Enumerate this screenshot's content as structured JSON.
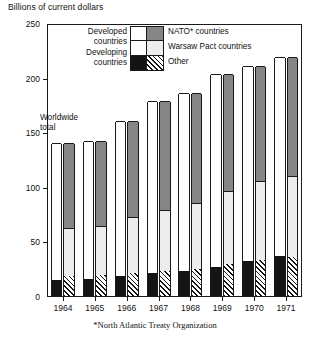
{
  "figure": {
    "axis_title": "Billions of current dollars",
    "annotation_line1": "Worldwide",
    "annotation_line2": "total",
    "footnote": "*North Atlantic Treaty Organization"
  },
  "legend": {
    "left_labels": [
      {
        "line1": "Developed",
        "line2": "countries"
      },
      {
        "line1": "Developing",
        "line2": "countries"
      }
    ],
    "right_labels": [
      "NATO* countries",
      "Warsaw Pact countries",
      "Other"
    ],
    "swatch_names": [
      "developed-white",
      "nato-dark-gray",
      "warsaw-light-gray",
      "developing-black",
      "other-hatched"
    ]
  },
  "colors": {
    "nato": "#868686",
    "warsaw": "#ededed",
    "developed": "#ffffff",
    "developing": "#141414",
    "other_hatch": "#141414",
    "axis": "#1a1a1a"
  },
  "chart_data": {
    "type": "bar",
    "title": "",
    "subtitle": "",
    "xlabel": "",
    "ylabel": "Billions of current dollars",
    "ylim": [
      0,
      250
    ],
    "yticks": [
      0,
      50,
      100,
      150,
      200,
      250
    ],
    "grid": false,
    "legend_position": "inside-top-left",
    "categories": [
      "1964",
      "1965",
      "1966",
      "1967",
      "1968",
      "1969",
      "1970",
      "1971"
    ],
    "totals": [
      140,
      142,
      160,
      179,
      186,
      203,
      211,
      219
    ],
    "bar_pairs": [
      {
        "year": "1964",
        "left_bar": {
          "name": "development-split",
          "segments": [
            {
              "key": "developed",
              "label": "Developed countries",
              "value": 125
            },
            {
              "key": "developing",
              "label": "Developing countries",
              "value": 15
            }
          ]
        },
        "right_bar": {
          "name": "alliance-split",
          "segments": [
            {
              "key": "nato",
              "label": "NATO* countries",
              "value": 78
            },
            {
              "key": "warsaw",
              "label": "Warsaw Pact countries",
              "value": 44
            },
            {
              "key": "other",
              "label": "Other",
              "value": 18
            }
          ]
        }
      },
      {
        "year": "1965",
        "left_bar": {
          "name": "development-split",
          "segments": [
            {
              "key": "developed",
              "label": "Developed countries",
              "value": 126
            },
            {
              "key": "developing",
              "label": "Developing countries",
              "value": 16
            }
          ]
        },
        "right_bar": {
          "name": "alliance-split",
          "segments": [
            {
              "key": "nato",
              "label": "NATO* countries",
              "value": 78
            },
            {
              "key": "warsaw",
              "label": "Warsaw Pact countries",
              "value": 45
            },
            {
              "key": "other",
              "label": "Other",
              "value": 19
            }
          ]
        }
      },
      {
        "year": "1966",
        "left_bar": {
          "name": "development-split",
          "segments": [
            {
              "key": "developed",
              "label": "Developed countries",
              "value": 142
            },
            {
              "key": "developing",
              "label": "Developing countries",
              "value": 18
            }
          ]
        },
        "right_bar": {
          "name": "alliance-split",
          "segments": [
            {
              "key": "nato",
              "label": "NATO* countries",
              "value": 88
            },
            {
              "key": "warsaw",
              "label": "Warsaw Pact countries",
              "value": 51
            },
            {
              "key": "other",
              "label": "Other",
              "value": 21
            }
          ]
        }
      },
      {
        "year": "1967",
        "left_bar": {
          "name": "development-split",
          "segments": [
            {
              "key": "developed",
              "label": "Developed countries",
              "value": 158
            },
            {
              "key": "developing",
              "label": "Developing countries",
              "value": 21
            }
          ]
        },
        "right_bar": {
          "name": "alliance-split",
          "segments": [
            {
              "key": "nato",
              "label": "NATO* countries",
              "value": 100
            },
            {
              "key": "warsaw",
              "label": "Warsaw Pact countries",
              "value": 56
            },
            {
              "key": "other",
              "label": "Other",
              "value": 23
            }
          ]
        }
      },
      {
        "year": "1968",
        "left_bar": {
          "name": "development-split",
          "segments": [
            {
              "key": "developed",
              "label": "Developed countries",
              "value": 163
            },
            {
              "key": "developing",
              "label": "Developing countries",
              "value": 23
            }
          ]
        },
        "right_bar": {
          "name": "alliance-split",
          "segments": [
            {
              "key": "nato",
              "label": "NATO* countries",
              "value": 101
            },
            {
              "key": "warsaw",
              "label": "Warsaw Pact countries",
              "value": 60
            },
            {
              "key": "other",
              "label": "Other",
              "value": 25
            }
          ]
        }
      },
      {
        "year": "1969",
        "left_bar": {
          "name": "development-split",
          "segments": [
            {
              "key": "developed",
              "label": "Developed countries",
              "value": 176
            },
            {
              "key": "developing",
              "label": "Developing countries",
              "value": 27
            }
          ]
        },
        "right_bar": {
          "name": "alliance-split",
          "segments": [
            {
              "key": "nato",
              "label": "NATO* countries",
              "value": 107
            },
            {
              "key": "warsaw",
              "label": "Warsaw Pact countries",
              "value": 67
            },
            {
              "key": "other",
              "label": "Other",
              "value": 29
            }
          ]
        }
      },
      {
        "year": "1970",
        "left_bar": {
          "name": "development-split",
          "segments": [
            {
              "key": "developed",
              "label": "Developed countries",
              "value": 179
            },
            {
              "key": "developing",
              "label": "Developing countries",
              "value": 32
            }
          ]
        },
        "right_bar": {
          "name": "alliance-split",
          "segments": [
            {
              "key": "nato",
              "label": "NATO* countries",
              "value": 106
            },
            {
              "key": "warsaw",
              "label": "Warsaw Pact countries",
              "value": 72
            },
            {
              "key": "other",
              "label": "Other",
              "value": 33
            }
          ]
        }
      },
      {
        "year": "1971",
        "left_bar": {
          "name": "development-split",
          "segments": [
            {
              "key": "developed",
              "label": "Developed countries",
              "value": 182
            },
            {
              "key": "developing",
              "label": "Developing countries",
              "value": 37
            }
          ]
        },
        "right_bar": {
          "name": "alliance-split",
          "segments": [
            {
              "key": "nato",
              "label": "NATO* countries",
              "value": 109
            },
            {
              "key": "warsaw",
              "label": "Warsaw Pact countries",
              "value": 74
            },
            {
              "key": "other",
              "label": "Other",
              "value": 36
            }
          ]
        }
      }
    ]
  }
}
